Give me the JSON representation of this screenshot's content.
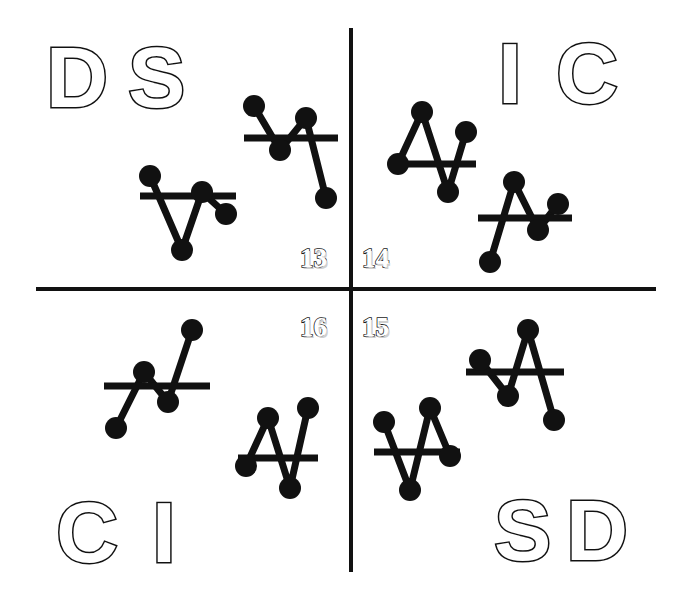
{
  "figure": {
    "background_color": "#ffffff",
    "ink_color": "#111111",
    "divider_color": "#111111"
  },
  "quadrants": [
    {
      "id": "top-left",
      "number": "13",
      "letters": [
        "D",
        "S"
      ],
      "glyph_count": 2
    },
    {
      "id": "top-right",
      "number": "14",
      "letters": [
        "I",
        "C"
      ],
      "glyph_count": 2
    },
    {
      "id": "bottom-left",
      "number": "16",
      "letters": [
        "C",
        "I"
      ],
      "glyph_count": 2
    },
    {
      "id": "bottom-right",
      "number": "15",
      "letters": [
        "S",
        "D"
      ],
      "glyph_count": 2
    }
  ],
  "letters": {
    "tl_1": "D",
    "tl_2": "S",
    "tr_1": "I",
    "tr_2": "C",
    "bl_1": "C",
    "bl_2": "I",
    "br_1": "S",
    "br_2": "D"
  },
  "numbers": {
    "tl": "13",
    "tr": "14",
    "bl": "16",
    "br": "15"
  },
  "chart_data": {
    "type": "line",
    "xlabel": "",
    "ylabel": "",
    "note": "Each glyph is a 4-point polyline with filled circular markers, crossed by a horizontal reference bar.",
    "glyphs": [
      {
        "name": "tl-glyph-1",
        "quadrant": "13",
        "x": [
          10,
          42,
          62,
          86
        ],
        "y": [
          18,
          92,
          34,
          56
        ],
        "bar_y": 38,
        "bar_x0": 0,
        "bar_x1": 96
      },
      {
        "name": "tl-glyph-2",
        "quadrant": "13",
        "x": [
          10,
          36,
          62,
          82
        ],
        "y": [
          12,
          56,
          24,
          104
        ],
        "bar_y": 44,
        "bar_x0": 0,
        "bar_x1": 94
      },
      {
        "name": "tr-glyph-1",
        "quadrant": "14",
        "x": [
          8,
          32,
          58,
          76
        ],
        "y": [
          66,
          14,
          94,
          34
        ],
        "bar_y": 66,
        "bar_x0": 0,
        "bar_x1": 86
      },
      {
        "name": "tr-glyph-2",
        "quadrant": "14",
        "x": [
          12,
          36,
          60,
          80
        ],
        "y": [
          100,
          20,
          68,
          42
        ],
        "bar_y": 56,
        "bar_x0": 0,
        "bar_x1": 94
      },
      {
        "name": "bl-glyph-1",
        "quadrant": "16",
        "x": [
          12,
          40,
          64,
          88
        ],
        "y": [
          110,
          54,
          84,
          12
        ],
        "bar_y": 68,
        "bar_x0": 0,
        "bar_x1": 106
      },
      {
        "name": "bl-glyph-2",
        "quadrant": "16",
        "x": [
          8,
          30,
          52,
          70
        ],
        "y": [
          66,
          18,
          88,
          8
        ],
        "bar_y": 58,
        "bar_x0": 0,
        "bar_x1": 80
      },
      {
        "name": "br-glyph-1",
        "quadrant": "15",
        "x": [
          10,
          36,
          56,
          76
        ],
        "y": [
          28,
          96,
          14,
          62
        ],
        "bar_y": 58,
        "bar_x0": 0,
        "bar_x1": 86
      },
      {
        "name": "br-glyph-2",
        "quadrant": "15",
        "x": [
          14,
          42,
          62,
          88
        ],
        "y": [
          42,
          78,
          12,
          102
        ],
        "bar_y": 54,
        "bar_x0": 0,
        "bar_x1": 98
      }
    ]
  }
}
